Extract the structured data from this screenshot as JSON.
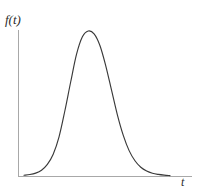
{
  "figure": {
    "background_color": "#ffffff",
    "axis_color": "#a8a8a8",
    "curve_color": "#3a3a3a",
    "y_axis_label": "f(t)",
    "x_axis_label": "t"
  },
  "chart_data": {
    "type": "line",
    "title": "",
    "subtitle": "",
    "xlabel": "t",
    "ylabel": "f(t)",
    "grid": false,
    "legend": null,
    "axes": {
      "x_axis_visible": true,
      "y_axis_visible": true,
      "ticks": [],
      "tick_labels": [],
      "xlim": [
        0,
        1
      ],
      "ylim": [
        0,
        1
      ]
    },
    "series": [
      {
        "name": "f(t)",
        "color": "#3a3a3a",
        "x": [
          0.0,
          0.04,
          0.08,
          0.12,
          0.16,
          0.2,
          0.24,
          0.28,
          0.32,
          0.36,
          0.4,
          0.44,
          0.48,
          0.52,
          0.56,
          0.6,
          0.64,
          0.68,
          0.72,
          0.76,
          0.8,
          0.84,
          0.88,
          0.92,
          0.96,
          1.0
        ],
        "y": [
          0.005,
          0.01,
          0.02,
          0.04,
          0.08,
          0.15,
          0.27,
          0.45,
          0.65,
          0.84,
          0.96,
          1.0,
          0.98,
          0.9,
          0.76,
          0.59,
          0.42,
          0.28,
          0.175,
          0.105,
          0.06,
          0.034,
          0.019,
          0.011,
          0.006,
          0.003
        ]
      }
    ]
  }
}
